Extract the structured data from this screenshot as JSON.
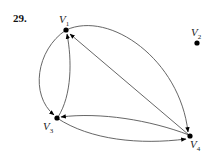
{
  "problem_number": "29.",
  "graph": {
    "vertices": [
      {
        "id": "V1",
        "base": "V",
        "sub": "1",
        "x": 66,
        "y": 30
      },
      {
        "id": "V2",
        "base": "V",
        "sub": "2",
        "x": 197,
        "y": 43
      },
      {
        "id": "V3",
        "base": "V",
        "sub": "3",
        "x": 57,
        "y": 118
      },
      {
        "id": "V4",
        "base": "V",
        "sub": "4",
        "x": 190,
        "y": 136
      }
    ],
    "edges": [
      {
        "from": "V1",
        "to": "V3"
      },
      {
        "from": "V3",
        "to": "V1"
      },
      {
        "from": "V4",
        "to": "V1"
      },
      {
        "from": "V1",
        "to": "V4"
      },
      {
        "from": "V4",
        "to": "V3"
      },
      {
        "from": "V3",
        "to": "V4"
      }
    ],
    "isolated_vertex": "V2"
  }
}
